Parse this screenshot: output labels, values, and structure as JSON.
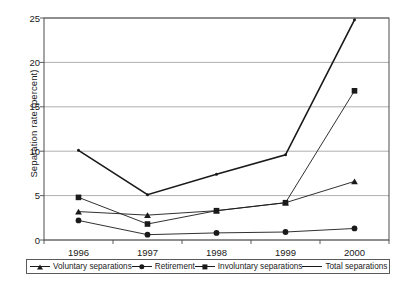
{
  "chart_data": {
    "type": "line",
    "title": "",
    "xlabel": "",
    "ylabel": "Separation rate (percent)",
    "categories": [
      "1996",
      "1997",
      "1998",
      "1999",
      "2000"
    ],
    "ylim": [
      0,
      25
    ],
    "yticks": [
      0,
      5,
      10,
      15,
      20,
      25
    ],
    "grid": "horizontal",
    "legend_position": "bottom",
    "series": [
      {
        "name": "Voluntary separations",
        "marker": "triangle",
        "values": [
          3.2,
          2.8,
          3.3,
          4.2,
          6.6
        ]
      },
      {
        "name": "Retirement",
        "marker": "circle",
        "values": [
          2.2,
          0.6,
          0.8,
          0.9,
          1.3
        ]
      },
      {
        "name": "Involuntary separations",
        "marker": "square",
        "values": [
          4.8,
          1.8,
          3.3,
          4.2,
          16.8
        ]
      },
      {
        "name": "Total separations",
        "marker": "plus",
        "values": [
          10.1,
          5.1,
          7.4,
          9.6,
          24.8
        ]
      }
    ]
  },
  "axis": {
    "ytick_labels": [
      "25",
      "20",
      "15",
      "10",
      "5",
      "0"
    ],
    "xtick_labels": [
      "1996",
      "1997",
      "1998",
      "1999",
      "2000"
    ],
    "y_axis_title": "Separation rate (percent)"
  },
  "legend": {
    "items": [
      {
        "label": "Voluntary separations",
        "marker": "triangle-marker"
      },
      {
        "label": "Retirement",
        "marker": "circle-marker"
      },
      {
        "label": "Involuntary separations",
        "marker": "square-marker"
      },
      {
        "label": "Total separations",
        "marker": "plus-marker"
      }
    ]
  },
  "colors": {
    "line": "#1a1a1a",
    "grid": "#9a9a9a",
    "frame": "#4d4d4d",
    "background": "#ffffff"
  }
}
